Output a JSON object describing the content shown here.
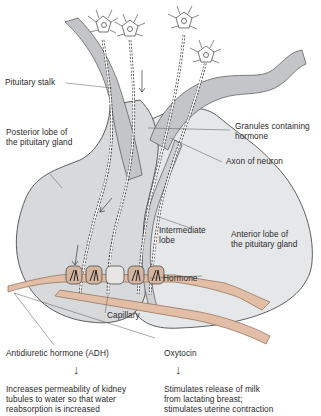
{
  "diagram": {
    "colors": {
      "gland_fill": "#d8d9db",
      "anterior_fill": "#e6e7e9",
      "stalk_fill": "#c4c5c8",
      "capillary_fill": "#e2bea6",
      "capillary_stroke": "#8a6a55",
      "outline": "#3a3a3a",
      "leader_line": "#555555"
    },
    "labels": {
      "pituitary_stalk": "Pituitary stalk",
      "granules": "Granules containing\nhormone",
      "posterior_lobe": "Posterior lobe of\nthe pituitary gland",
      "axon": "Axon of neuron",
      "intermediate_lobe": "Intermediate\nlobe",
      "anterior_lobe": "Anterior lobe of\nthe pituitary gland",
      "hormone": "Hormone",
      "capillary": "Capillary"
    },
    "outputs": {
      "adh": {
        "name": "Antidiuretic hormone (ADH)",
        "arrow": "↓",
        "effect": "Increases permeability of kidney\ntubules to water so that water\nreabsorption is increased"
      },
      "oxytocin": {
        "name": "Oxytocin",
        "arrow": "↓",
        "effect": "Stimulates release of milk\nfrom lactating breast;\nstimulates uterine contraction"
      }
    }
  }
}
